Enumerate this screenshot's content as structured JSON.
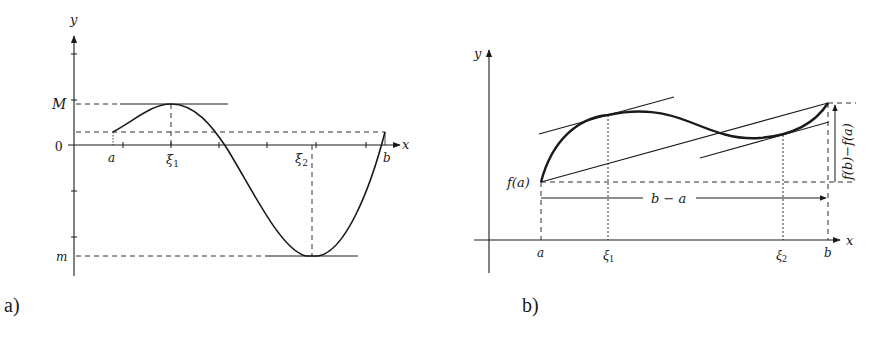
{
  "colors": {
    "ink": "#1a1a1a",
    "background": "#ffffff"
  },
  "panel_a": {
    "caption": "a)",
    "axis_x_label": "x",
    "axis_y_label": "y",
    "y_labels": {
      "max": "M",
      "zero": "0",
      "min": "m"
    },
    "x_labels": {
      "a": "a",
      "xi1": "ξ",
      "xi1_sub": "1",
      "xi2": "ξ",
      "xi2_sub": "2",
      "b": "b"
    }
  },
  "panel_b": {
    "caption": "b)",
    "axis_x_label": "x",
    "axis_y_label": "y",
    "fa_label": "f(a)",
    "span_label": "b − a",
    "rise_label": "f(b)−f(a)",
    "x_labels": {
      "a": "a",
      "xi1": "ξ",
      "xi1_sub": "1",
      "xi2": "ξ",
      "xi2_sub": "2",
      "b": "b"
    }
  }
}
